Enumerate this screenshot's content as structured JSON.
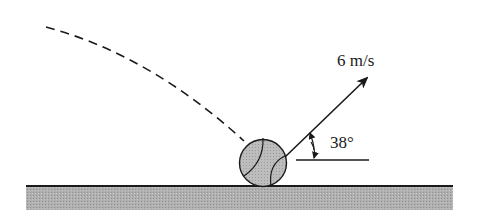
{
  "diagram": {
    "velocity_label": "6 m/s",
    "angle_label": "38°",
    "colors": {
      "ink": "#1a1a1a",
      "ground": "#a9a9a9",
      "ball": "#b4b4b4"
    }
  }
}
